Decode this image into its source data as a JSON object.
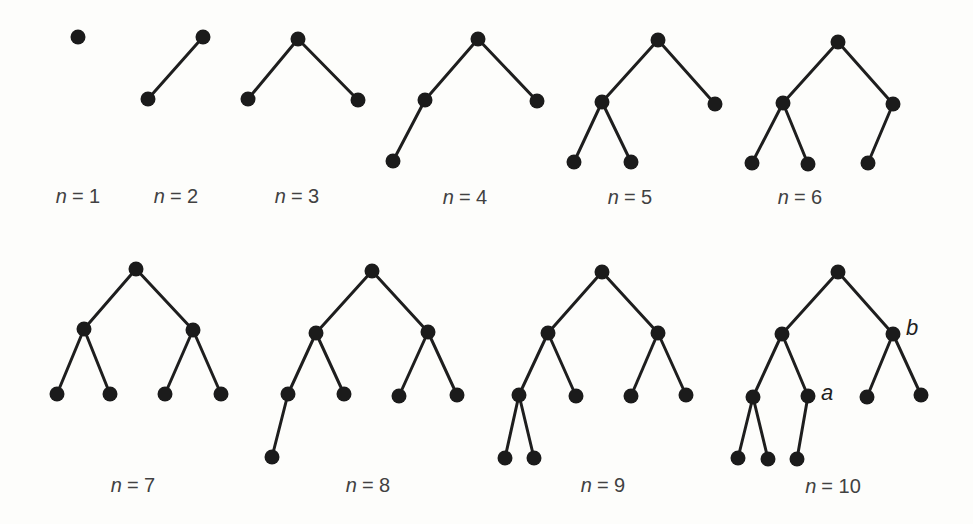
{
  "figure": {
    "background": "#fdfdfb",
    "node_color": "#1b1b1b",
    "edge_color": "#1e1e1e",
    "label_color": "#414141",
    "node_radius": 7.5,
    "edge_width": 3
  },
  "trees": [
    {
      "n": 1,
      "label": "n = 1",
      "var": "n",
      "rest": "= 1",
      "label_x": 78,
      "label_y": 196,
      "nodes": [
        {
          "x": 78,
          "y": 37
        }
      ],
      "edges": [],
      "node_labels": []
    },
    {
      "n": 2,
      "label": "n = 2",
      "var": "n",
      "rest": "= 2",
      "label_x": 176,
      "label_y": 196,
      "nodes": [
        {
          "x": 203,
          "y": 37
        },
        {
          "x": 148,
          "y": 99
        }
      ],
      "edges": [
        [
          0,
          1
        ]
      ],
      "node_labels": []
    },
    {
      "n": 3,
      "label": "n = 3",
      "var": "n",
      "rest": "= 3",
      "label_x": 297,
      "label_y": 196,
      "nodes": [
        {
          "x": 298,
          "y": 39
        },
        {
          "x": 248,
          "y": 99
        },
        {
          "x": 358,
          "y": 100
        }
      ],
      "edges": [
        [
          0,
          1
        ],
        [
          0,
          2
        ]
      ],
      "node_labels": []
    },
    {
      "n": 4,
      "label": "n = 4",
      "var": "n",
      "rest": "= 4",
      "label_x": 465,
      "label_y": 197,
      "nodes": [
        {
          "x": 478,
          "y": 39
        },
        {
          "x": 425,
          "y": 100
        },
        {
          "x": 537,
          "y": 101
        },
        {
          "x": 393,
          "y": 161
        }
      ],
      "edges": [
        [
          0,
          1
        ],
        [
          0,
          2
        ],
        [
          1,
          3
        ]
      ],
      "node_labels": []
    },
    {
      "n": 5,
      "label": "n = 5",
      "var": "n",
      "rest": "= 5",
      "label_x": 630,
      "label_y": 197,
      "nodes": [
        {
          "x": 658,
          "y": 40
        },
        {
          "x": 602,
          "y": 102
        },
        {
          "x": 715,
          "y": 104
        },
        {
          "x": 574,
          "y": 162
        },
        {
          "x": 631,
          "y": 162
        }
      ],
      "edges": [
        [
          0,
          1
        ],
        [
          0,
          2
        ],
        [
          1,
          3
        ],
        [
          1,
          4
        ]
      ],
      "node_labels": []
    },
    {
      "n": 6,
      "label": "n = 6",
      "var": "n",
      "rest": "= 6",
      "label_x": 800,
      "label_y": 197,
      "nodes": [
        {
          "x": 838,
          "y": 42
        },
        {
          "x": 783,
          "y": 103
        },
        {
          "x": 893,
          "y": 104
        },
        {
          "x": 752,
          "y": 163
        },
        {
          "x": 808,
          "y": 164
        },
        {
          "x": 868,
          "y": 163
        }
      ],
      "edges": [
        [
          0,
          1
        ],
        [
          0,
          2
        ],
        [
          1,
          3
        ],
        [
          1,
          4
        ],
        [
          2,
          5
        ]
      ],
      "node_labels": []
    },
    {
      "n": 7,
      "label": "n = 7",
      "var": "n",
      "rest": "= 7",
      "label_x": 133,
      "label_y": 485,
      "nodes": [
        {
          "x": 136,
          "y": 269
        },
        {
          "x": 84,
          "y": 329
        },
        {
          "x": 193,
          "y": 330
        },
        {
          "x": 57,
          "y": 394
        },
        {
          "x": 110,
          "y": 394
        },
        {
          "x": 165,
          "y": 394
        },
        {
          "x": 221,
          "y": 394
        }
      ],
      "edges": [
        [
          0,
          1
        ],
        [
          0,
          2
        ],
        [
          1,
          3
        ],
        [
          1,
          4
        ],
        [
          2,
          5
        ],
        [
          2,
          6
        ]
      ],
      "node_labels": []
    },
    {
      "n": 8,
      "label": "n = 8",
      "var": "n",
      "rest": "= 8",
      "label_x": 368,
      "label_y": 485,
      "nodes": [
        {
          "x": 372,
          "y": 271
        },
        {
          "x": 316,
          "y": 333
        },
        {
          "x": 428,
          "y": 332
        },
        {
          "x": 288,
          "y": 394
        },
        {
          "x": 344,
          "y": 394
        },
        {
          "x": 399,
          "y": 396
        },
        {
          "x": 457,
          "y": 395
        },
        {
          "x": 272,
          "y": 457
        }
      ],
      "edges": [
        [
          0,
          1
        ],
        [
          0,
          2
        ],
        [
          1,
          3
        ],
        [
          1,
          4
        ],
        [
          2,
          5
        ],
        [
          2,
          6
        ],
        [
          3,
          7
        ]
      ],
      "node_labels": []
    },
    {
      "n": 9,
      "label": "n = 9",
      "var": "n",
      "rest": "= 9",
      "label_x": 603,
      "label_y": 485,
      "nodes": [
        {
          "x": 602,
          "y": 272
        },
        {
          "x": 548,
          "y": 333
        },
        {
          "x": 658,
          "y": 333
        },
        {
          "x": 519,
          "y": 395
        },
        {
          "x": 576,
          "y": 396
        },
        {
          "x": 631,
          "y": 396
        },
        {
          "x": 686,
          "y": 395
        },
        {
          "x": 505,
          "y": 458
        },
        {
          "x": 534,
          "y": 458
        }
      ],
      "edges": [
        [
          0,
          1
        ],
        [
          0,
          2
        ],
        [
          1,
          3
        ],
        [
          1,
          4
        ],
        [
          2,
          5
        ],
        [
          2,
          6
        ],
        [
          3,
          7
        ],
        [
          3,
          8
        ]
      ],
      "node_labels": []
    },
    {
      "n": 10,
      "label": "n = 10",
      "var": "n",
      "rest": "= 10",
      "label_x": 833,
      "label_y": 486,
      "nodes": [
        {
          "x": 838,
          "y": 272
        },
        {
          "x": 782,
          "y": 334
        },
        {
          "x": 893,
          "y": 334
        },
        {
          "x": 753,
          "y": 397
        },
        {
          "x": 808,
          "y": 396
        },
        {
          "x": 867,
          "y": 397
        },
        {
          "x": 921,
          "y": 395
        },
        {
          "x": 738,
          "y": 458
        },
        {
          "x": 768,
          "y": 459
        },
        {
          "x": 797,
          "y": 459
        }
      ],
      "edges": [
        [
          0,
          1
        ],
        [
          0,
          2
        ],
        [
          1,
          3
        ],
        [
          1,
          4
        ],
        [
          2,
          5
        ],
        [
          2,
          6
        ],
        [
          3,
          7
        ],
        [
          3,
          8
        ],
        [
          4,
          9
        ]
      ],
      "node_labels": [
        {
          "text": "a",
          "x": 827,
          "y": 393
        },
        {
          "text": "b",
          "x": 912,
          "y": 328
        }
      ]
    }
  ]
}
